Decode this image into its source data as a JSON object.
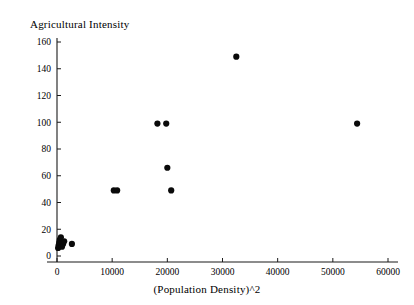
{
  "chart_data": {
    "type": "scatter",
    "title": "Agricultural Intensity",
    "xlabel": "(Population Density)^2",
    "ylabel": "Agricultural Intensity",
    "xlim": [
      0,
      60000
    ],
    "ylim": [
      0,
      160
    ],
    "xticks": [
      0,
      10000,
      20000,
      30000,
      40000,
      50000,
      60000
    ],
    "yticks": [
      0,
      20,
      40,
      60,
      80,
      100,
      120,
      140,
      160
    ],
    "xtick_labels": [
      "0",
      "10000",
      "20000",
      "30000",
      "40000",
      "50000",
      "60000"
    ],
    "ytick_labels": [
      "0",
      "20",
      "40",
      "60",
      "80",
      "100",
      "120",
      "140",
      "160"
    ],
    "grid": false,
    "legend": false,
    "marker": "filled-circle",
    "marker_color": "#0a0a0a",
    "points": [
      {
        "x": 200,
        "y": 6
      },
      {
        "x": 300,
        "y": 8
      },
      {
        "x": 400,
        "y": 10
      },
      {
        "x": 500,
        "y": 12
      },
      {
        "x": 700,
        "y": 14
      },
      {
        "x": 900,
        "y": 7
      },
      {
        "x": 1100,
        "y": 9
      },
      {
        "x": 1300,
        "y": 11
      },
      {
        "x": 2700,
        "y": 9
      },
      {
        "x": 10300,
        "y": 49
      },
      {
        "x": 10900,
        "y": 49
      },
      {
        "x": 18200,
        "y": 99
      },
      {
        "x": 19800,
        "y": 99
      },
      {
        "x": 20000,
        "y": 66
      },
      {
        "x": 20700,
        "y": 49
      },
      {
        "x": 32500,
        "y": 149
      },
      {
        "x": 54400,
        "y": 99
      }
    ]
  }
}
